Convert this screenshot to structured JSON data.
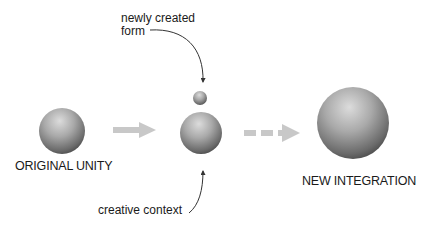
{
  "diagram": {
    "nodes": [
      {
        "id": "original-unity",
        "label": "ORIGINAL UNITY"
      },
      {
        "id": "newly-created-form",
        "label": ""
      },
      {
        "id": "transition-sphere",
        "label": ""
      },
      {
        "id": "new-integration",
        "label": "NEW INTEGRATION"
      }
    ],
    "annotations": {
      "newly_created_form_line1": "newly created",
      "newly_created_form_line2": "form",
      "creative_context": "creative context"
    },
    "edges": [
      {
        "from": "original-unity",
        "to": "transition-sphere",
        "style": "solid",
        "color": "#c8c8c8"
      },
      {
        "from": "transition-sphere",
        "to": "new-integration",
        "style": "dashed",
        "color": "#c8c8c8"
      }
    ],
    "colors": {
      "sphere_light": "#e2e2e2",
      "sphere_mid": "#a8a8a8",
      "sphere_dark": "#4e4e4e",
      "arrow_gray": "#c8c8c8",
      "pointer": "#333333",
      "text": "#1a1a1a"
    }
  }
}
